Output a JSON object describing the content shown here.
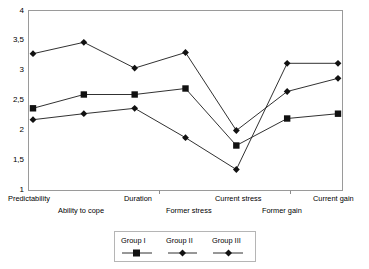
{
  "chart_data": {
    "type": "line",
    "title": "",
    "subtitle": "",
    "xlabel": "",
    "ylabel": "",
    "ylim": [
      1,
      4
    ],
    "yticks": [
      1,
      1.5,
      2,
      2.5,
      3,
      3.5,
      4
    ],
    "ytick_labels": [
      "1",
      "1,5",
      "2",
      "2,5",
      "3",
      "3,5",
      "4"
    ],
    "grid": false,
    "legend_position": "bottom",
    "categories": [
      "Predictability",
      "Ability to cope",
      "Duration",
      "Former stress",
      "Current stress",
      "Former gain",
      "Current gain"
    ],
    "series": [
      {
        "name": "Group I",
        "marker": "square",
        "values": [
          2.37,
          2.6,
          2.6,
          2.7,
          1.75,
          2.2,
          2.28
        ]
      },
      {
        "name": "Group II",
        "marker": "diamond",
        "values": [
          3.28,
          3.47,
          3.04,
          3.3,
          2.0,
          2.65,
          2.87
        ]
      },
      {
        "name": "Group III",
        "marker": "diamond",
        "values": [
          2.18,
          2.28,
          2.37,
          1.88,
          1.35,
          3.12,
          3.12
        ]
      }
    ]
  },
  "axis": {
    "y_tick_labels": [
      "4",
      "3,5",
      "3",
      "2,5",
      "2",
      "1,5",
      "1"
    ],
    "x_tick_labels_top": [
      "Predictability",
      "Duration",
      "Current stress",
      "Current gain"
    ],
    "x_tick_labels_bottom": [
      "Ability to cope",
      "Former stress",
      "Former gain"
    ]
  },
  "legend": {
    "entries": [
      {
        "label": "Group I",
        "marker": "square-marker"
      },
      {
        "label": "Group II",
        "marker": "diamond-marker"
      },
      {
        "label": "Group III",
        "marker": "diamond-marker"
      }
    ]
  },
  "colors": {
    "line": "#1a1a1a",
    "marker": "#111111",
    "frame": "#9a9a9a",
    "background": "#ffffff"
  }
}
